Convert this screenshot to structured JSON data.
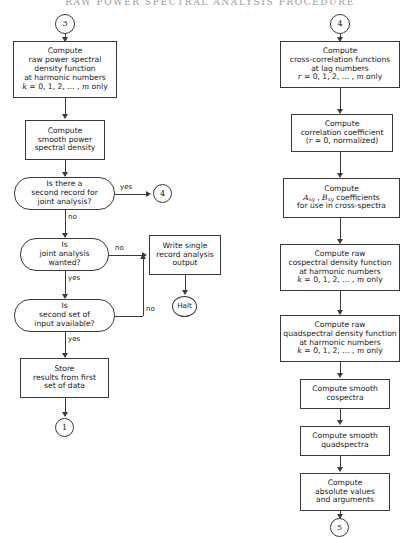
{
  "page": {
    "running_head": "RAW POWER SPECTRAL ANALYSIS PROCEDURE",
    "width": 420,
    "height": 538,
    "ink_color": "#3a3a3a",
    "background": "#ffffff"
  },
  "flowchart": {
    "type": "flowchart",
    "orientation": "two-column",
    "left_column": {
      "entry_connector": "3",
      "nodes": [
        {
          "id": "raw-psd",
          "shape": "process",
          "lines": [
            "Compute",
            "raw power spectral",
            "density function",
            "at harmonic numbers",
            "k = 0, 1, 2, … , m only"
          ]
        },
        {
          "id": "smooth-psd",
          "shape": "process",
          "lines": [
            "Compute",
            "smooth power",
            "spectral density"
          ]
        },
        {
          "id": "second-record-decision",
          "shape": "decision",
          "lines": [
            "Is there a",
            "second record for",
            "joint analysis?"
          ]
        },
        {
          "id": "joint-analysis-decision",
          "shape": "decision",
          "lines": [
            "Is",
            "joint analysis",
            "wanted?"
          ]
        },
        {
          "id": "second-set-decision",
          "shape": "decision",
          "lines": [
            "Is",
            "second set of",
            "input available?"
          ]
        },
        {
          "id": "store-results",
          "shape": "process",
          "lines": [
            "Store",
            "results from first",
            "set of data"
          ]
        },
        {
          "id": "write-output",
          "shape": "process",
          "lines": [
            "Write single",
            "record analysis",
            "output"
          ]
        }
      ],
      "terminals": [
        {
          "id": "halt",
          "label": "Halt",
          "shape": "terminal"
        }
      ],
      "exit_connectors": [
        {
          "id": "to-4",
          "label": "4"
        },
        {
          "id": "to-1",
          "label": "1"
        }
      ],
      "edge_labels": [
        "yes",
        "no",
        "no",
        "yes",
        "no",
        "yes"
      ]
    },
    "right_column": {
      "entry_connector": "4",
      "nodes": [
        {
          "id": "cross-correlation",
          "shape": "process",
          "lines": [
            "Compute",
            "cross-correlation functions",
            "at lag numbers",
            "r = 0, 1, 2, … , m only"
          ]
        },
        {
          "id": "correlation-coefficient",
          "shape": "process",
          "lines": [
            "Compute",
            "correlation coefficient",
            "(r = 0, normalized)"
          ]
        },
        {
          "id": "axy-bxy-coefficients",
          "shape": "process",
          "lines": [
            "Compute",
            "Axy , Bxy coefficients",
            "for use in cross-spectra"
          ]
        },
        {
          "id": "raw-cospectral",
          "shape": "process",
          "lines": [
            "Compute raw",
            "cospectral density function",
            "at harmonic numbers",
            "k = 0, 1, 2, … , m only"
          ]
        },
        {
          "id": "raw-quadspectral",
          "shape": "process",
          "lines": [
            "Compute raw",
            "quadspectral density function",
            "at harmonic numbers",
            "k = 0, 1, 2, … , m only"
          ]
        },
        {
          "id": "smooth-cospectra",
          "shape": "process",
          "lines": [
            "Compute smooth",
            "cospectra"
          ]
        },
        {
          "id": "smooth-quadspectra",
          "shape": "process",
          "lines": [
            "Compute smooth",
            "quadspectra"
          ]
        },
        {
          "id": "absolute-values",
          "shape": "process",
          "lines": [
            "Compute",
            "absolute values",
            "and arguments"
          ]
        }
      ],
      "exit_connectors": [
        {
          "id": "to-5",
          "label": "5"
        }
      ]
    }
  },
  "labels": {
    "connector_3": "3",
    "connector_4_left": "4",
    "connector_1": "1",
    "connector_4_right": "4",
    "connector_5": "5",
    "halt": "Halt",
    "yes": "yes",
    "no": "no",
    "compute": "Compute",
    "compute_raw": "Compute raw",
    "compute_smooth": "Compute smooth",
    "raw_power_spectral": "raw power spectral",
    "density_function": "density function",
    "at_harmonic_numbers": "at harmonic numbers",
    "k_series": "= 0, 1, 2, … ,",
    "only": "only",
    "smooth_power": "smooth power",
    "spectral_density": "spectral density",
    "is_there_a": "Is there a",
    "second_record_for": "second record for",
    "joint_analysis_q": "joint analysis?",
    "is": "Is",
    "joint_analysis": "joint analysis",
    "wanted_q": "wanted?",
    "second_set_of": "second set of",
    "input_available_q": "input available?",
    "store": "Store",
    "results_from_first": "results from first",
    "set_of_data": "set of data",
    "write_single": "Write single",
    "record_analysis": "record analysis",
    "output": "output",
    "cross_correlation_functions": "cross-correlation functions",
    "at_lag_numbers": "at lag numbers",
    "r_series": "= 0, 1, 2, … ,",
    "correlation_coefficient": "correlation coefficient",
    "r_zero_normalized": "= 0, normalized)",
    "coefficients": "coefficients",
    "for_use_in_cross_spectra": "for use in cross-spectra",
    "cospectral_density_function": "cospectral density function",
    "quadspectral_density_function": "quadspectral density function",
    "cospectra": "cospectra",
    "quadspectra": "quadspectra",
    "absolute_values": "absolute values",
    "and_arguments": "and arguments"
  }
}
